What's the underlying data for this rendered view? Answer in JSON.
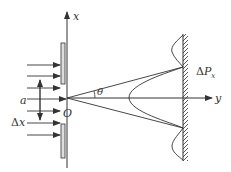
{
  "diagram": {
    "labels": {
      "x_axis": "x",
      "y_axis": "y",
      "origin": "O",
      "angle": "θ",
      "slit_width": "a",
      "delta_x_prefix": "Δ",
      "delta_x_var": "x",
      "delta_p_prefix": "Δ",
      "delta_p_var": "P",
      "delta_p_sub": "x"
    },
    "colors": {
      "line": "#333333",
      "plate_fill": "#dddddd",
      "background": "#ffffff"
    },
    "incident_ray_count": 7
  }
}
